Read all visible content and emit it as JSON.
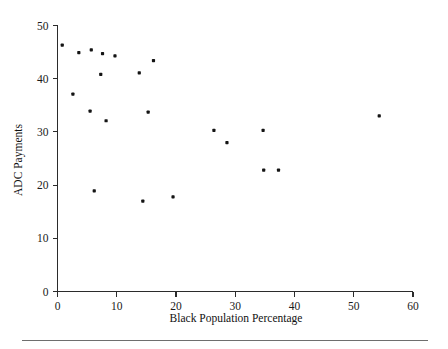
{
  "chart_data": {
    "type": "scatter",
    "title": "",
    "xlabel": "Black Population Percentage",
    "ylabel": "ADC Payments",
    "xlim": [
      0,
      60
    ],
    "ylim": [
      0,
      50
    ],
    "xticks": [
      0,
      10,
      20,
      30,
      40,
      50,
      60
    ],
    "yticks": [
      0,
      10,
      20,
      30,
      40,
      50
    ],
    "xtick_labels": [
      "0",
      "10",
      "20",
      "30",
      "40",
      "50",
      "60"
    ],
    "ytick_labels": [
      "0",
      "10",
      "20",
      "30",
      "40",
      "50"
    ],
    "grid": false,
    "legend": null,
    "marker": "filled-square-dot",
    "marker_color": "#141414",
    "points": [
      {
        "x": 0.8,
        "y": 46.3
      },
      {
        "x": 2.6,
        "y": 37.1
      },
      {
        "x": 3.6,
        "y": 44.9
      },
      {
        "x": 5.5,
        "y": 33.9
      },
      {
        "x": 5.7,
        "y": 45.4
      },
      {
        "x": 6.2,
        "y": 18.9
      },
      {
        "x": 7.3,
        "y": 40.8
      },
      {
        "x": 7.6,
        "y": 44.7
      },
      {
        "x": 8.2,
        "y": 32.1
      },
      {
        "x": 9.7,
        "y": 44.3
      },
      {
        "x": 13.8,
        "y": 41.1
      },
      {
        "x": 14.4,
        "y": 17.0
      },
      {
        "x": 15.3,
        "y": 33.7
      },
      {
        "x": 16.2,
        "y": 43.4
      },
      {
        "x": 19.5,
        "y": 17.8
      },
      {
        "x": 26.4,
        "y": 30.3
      },
      {
        "x": 28.6,
        "y": 28.0
      },
      {
        "x": 34.7,
        "y": 30.3
      },
      {
        "x": 34.8,
        "y": 22.8
      },
      {
        "x": 37.3,
        "y": 22.8
      },
      {
        "x": 54.3,
        "y": 33.0
      }
    ]
  },
  "figure": {
    "background_color": "#ffffff",
    "axis_color": "#2b2b2b",
    "footer_rule_color": "#6e6e6e"
  }
}
